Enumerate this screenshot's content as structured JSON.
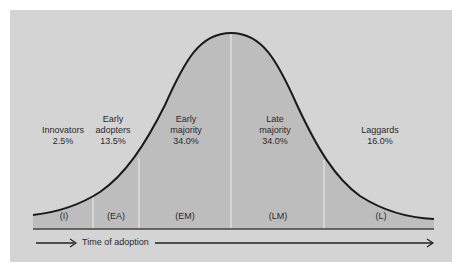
{
  "diagram": {
    "type": "bell-curve",
    "segments": [
      {
        "name": "Innovators",
        "line1": "",
        "line2": "Innovators",
        "percent": "2.5%",
        "abbr": "(I)"
      },
      {
        "name": "Early adopters",
        "line1": "Early",
        "line2": "adopters",
        "percent": "13.5%",
        "abbr": "(EA)"
      },
      {
        "name": "Early majority",
        "line1": "Early",
        "line2": "majority",
        "percent": "34.0%",
        "abbr": "(EM)"
      },
      {
        "name": "Late majority",
        "line1": "Late",
        "line2": "majority",
        "percent": "34.0%",
        "abbr": "(LM)"
      },
      {
        "name": "Laggards",
        "line1": "",
        "line2": "Laggards",
        "percent": "16.0%",
        "abbr": "(L)"
      }
    ],
    "axis_label": "Time of adoption",
    "colors": {
      "background": "#d4d4d4",
      "fill": "#bdbdbd",
      "curve": "#1a1a1a",
      "divider": "#eeeeee"
    }
  }
}
